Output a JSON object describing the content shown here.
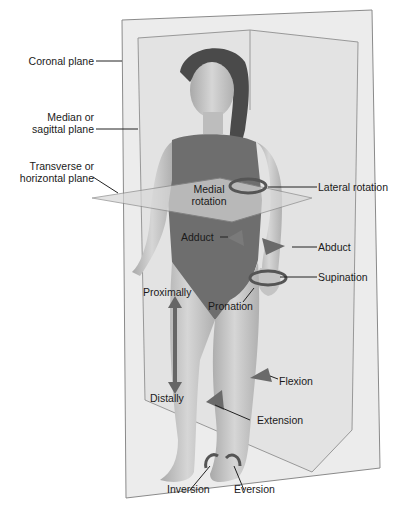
{
  "figure": {
    "colors": {
      "plane_fill": "#e4e4e4",
      "plane_stroke": "#8a8a8a",
      "skin": "#c9c9c9",
      "swimsuit": "#6e6e6e",
      "arrow": "#6a6a6a",
      "text": "#1a1a1a"
    }
  },
  "planes": [
    {
      "id": "coronal",
      "label": "Coronal plane"
    },
    {
      "id": "sagittal",
      "label_line1": "Median or",
      "label_line2": "sagittal plane"
    },
    {
      "id": "transverse",
      "label_line1": "Transverse or",
      "label_line2": "horizontal plane"
    }
  ],
  "movements": {
    "medial_rotation": {
      "line1": "Medial",
      "line2": "rotation"
    },
    "lateral_rotation": "Lateral rotation",
    "adduct": "Adduct",
    "abduct": "Abduct",
    "supination": "Supination",
    "pronation": "Pronation",
    "proximally": "Proximally",
    "distally": "Distally",
    "flexion": "Flexion",
    "extension": "Extension",
    "inversion": "Inversion",
    "eversion": "Eversion"
  }
}
